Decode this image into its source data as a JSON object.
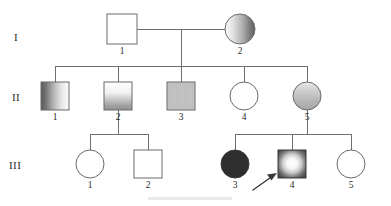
{
  "diagram": {
    "kind": "pedigree-chart",
    "background_color": "#ffffff",
    "line_color": "#6f6f6f",
    "text_color": "#2b2b2b"
  },
  "generations": [
    {
      "id": "I",
      "label": "I",
      "label_x": 14,
      "label_y": 41
    },
    {
      "id": "II",
      "label": "II",
      "label_x": 12,
      "label_y": 101
    },
    {
      "id": "III",
      "label": "III",
      "label_x": 9,
      "label_y": 169
    }
  ],
  "legend_colors": {
    "unaffected_fill": "#ffffff",
    "affected_fill": "#2e2e2e",
    "carrier_gray": "#9a9a9a",
    "outline": "#6a6a6a",
    "proband_marker": "#3a3a3a"
  },
  "individuals": [
    {
      "key": "I-1",
      "generation": "I",
      "number": "1",
      "sex": "male",
      "shape": "square",
      "fill_style": "open",
      "cx": 122,
      "cy": 29,
      "size": 30,
      "label_x": 122,
      "label_y": 54
    },
    {
      "key": "I-2",
      "generation": "I",
      "number": "2",
      "sex": "female",
      "shape": "circle",
      "fill_style": "gradient-horizontal-light-to-dark",
      "cx": 240,
      "cy": 29,
      "size": 30,
      "label_x": 240,
      "label_y": 54
    },
    {
      "key": "II-1",
      "generation": "II",
      "number": "1",
      "sex": "male",
      "shape": "square",
      "fill_style": "gradient-horizontal-dark-to-light",
      "cx": 55,
      "cy": 96,
      "size": 28,
      "label_x": 55,
      "label_y": 120
    },
    {
      "key": "II-2",
      "generation": "II",
      "number": "2",
      "sex": "male",
      "shape": "square",
      "fill_style": "gradient-vertical-light-to-dark",
      "cx": 118,
      "cy": 96,
      "size": 28,
      "label_x": 118,
      "label_y": 120
    },
    {
      "key": "II-3",
      "generation": "II",
      "number": "3",
      "sex": "male",
      "shape": "square",
      "fill_style": "solid-light-gray",
      "cx": 181,
      "cy": 96,
      "size": 28,
      "label_x": 181,
      "label_y": 120
    },
    {
      "key": "II-4",
      "generation": "II",
      "number": "4",
      "sex": "female",
      "shape": "circle",
      "fill_style": "open",
      "cx": 244,
      "cy": 96,
      "size": 28,
      "label_x": 244,
      "label_y": 120
    },
    {
      "key": "II-5",
      "generation": "II",
      "number": "5",
      "sex": "female",
      "shape": "circle",
      "fill_style": "gradient-vertical-light-gray",
      "cx": 307,
      "cy": 96,
      "size": 28,
      "label_x": 307,
      "label_y": 120
    },
    {
      "key": "III-1",
      "generation": "III",
      "number": "1",
      "sex": "female",
      "shape": "circle",
      "fill_style": "open",
      "cx": 90,
      "cy": 164,
      "size": 28,
      "label_x": 90,
      "label_y": 188
    },
    {
      "key": "III-2",
      "generation": "III",
      "number": "2",
      "sex": "male",
      "shape": "square",
      "fill_style": "open",
      "cx": 148,
      "cy": 164,
      "size": 28,
      "label_x": 148,
      "label_y": 188
    },
    {
      "key": "III-3",
      "generation": "III",
      "number": "3",
      "sex": "female",
      "shape": "circle",
      "fill_style": "solid-dark",
      "cx": 235,
      "cy": 164,
      "size": 28,
      "label_x": 235,
      "label_y": 188
    },
    {
      "key": "III-4",
      "generation": "III",
      "number": "4",
      "sex": "male",
      "shape": "square",
      "fill_style": "radial-dark-edge-light-center",
      "cx": 292,
      "cy": 164,
      "size": 28,
      "label_x": 292,
      "label_y": 188,
      "proband": true
    },
    {
      "key": "III-5",
      "generation": "III",
      "number": "5",
      "sex": "female",
      "shape": "circle",
      "fill_style": "open",
      "cx": 351,
      "cy": 164,
      "size": 28,
      "label_x": 351,
      "label_y": 188
    }
  ],
  "matings": [
    {
      "key": "I1-x-I2",
      "partner_a": "I-1",
      "partner_b": "I-2",
      "mating_line": {
        "x1": 137,
        "y1": 29,
        "x2": 225,
        "y2": 29
      },
      "drop": {
        "x": 181,
        "y1": 29,
        "y2": 66
      },
      "sibship_line": {
        "x1": 55,
        "y1": 66,
        "x2": 307,
        "y2": 66
      },
      "children": [
        "II-1",
        "II-2",
        "II-3",
        "II-4",
        "II-5"
      ]
    },
    {
      "key": "II2-sibship",
      "partner_a": "II-2",
      "partner_b": null,
      "mating_line": null,
      "drop": {
        "x": 118,
        "y1": 110,
        "y2": 134
      },
      "sibship_line": {
        "x1": 90,
        "y1": 134,
        "x2": 148,
        "y2": 134
      },
      "children": [
        "III-1",
        "III-2"
      ]
    },
    {
      "key": "II5-sibship",
      "partner_a": "II-5",
      "partner_b": null,
      "mating_line": null,
      "drop": {
        "x": 307,
        "y1": 110,
        "y2": 134
      },
      "sibship_line": {
        "x1": 235,
        "y1": 134,
        "x2": 351,
        "y2": 134
      },
      "children": [
        "III-3",
        "III-4",
        "III-5"
      ]
    }
  ],
  "child_stems": [
    {
      "key": "stem-II-1",
      "x": 55,
      "y1": 66,
      "y2": 82
    },
    {
      "key": "stem-II-2",
      "x": 118,
      "y1": 66,
      "y2": 82
    },
    {
      "key": "stem-II-3",
      "x": 181,
      "y1": 66,
      "y2": 82
    },
    {
      "key": "stem-II-4",
      "x": 244,
      "y1": 66,
      "y2": 82
    },
    {
      "key": "stem-II-5",
      "x": 307,
      "y1": 66,
      "y2": 82
    },
    {
      "key": "stem-III-1",
      "x": 90,
      "y1": 134,
      "y2": 150
    },
    {
      "key": "stem-III-2",
      "x": 148,
      "y1": 134,
      "y2": 150
    },
    {
      "key": "stem-III-3",
      "x": 235,
      "y1": 134,
      "y2": 150
    },
    {
      "key": "stem-III-4",
      "x": 292,
      "y1": 134,
      "y2": 150
    },
    {
      "key": "stem-III-5",
      "x": 351,
      "y1": 134,
      "y2": 150
    }
  ],
  "proband": {
    "target": "III-4",
    "arrow_tail_x": 253,
    "arrow_tail_y": 190,
    "arrow_tip_x": 276,
    "arrow_tip_y": 174
  }
}
